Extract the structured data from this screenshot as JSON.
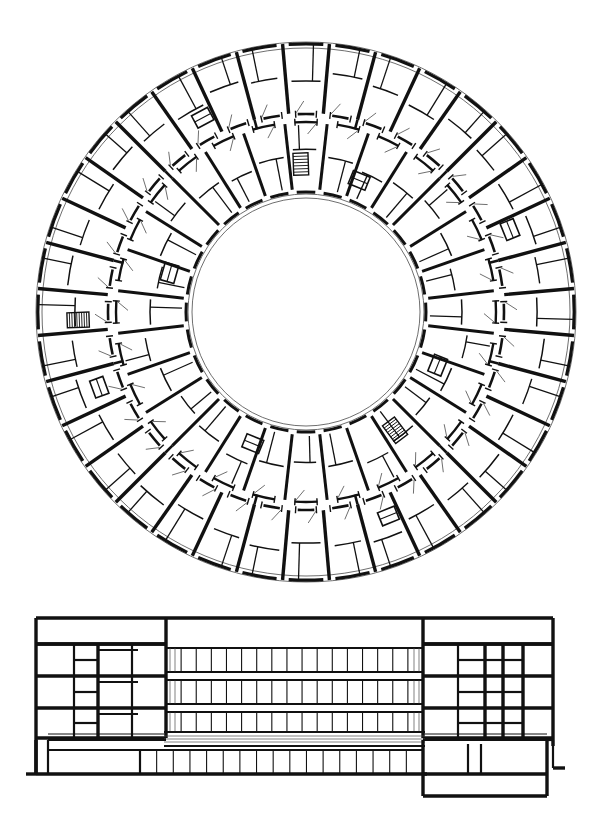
{
  "drawing": {
    "kind": "architectural-drawing",
    "sheet_background": "#ffffff",
    "ink_color": "#111111",
    "hairline_color": "#4a4a4a",
    "sheet_width": 589,
    "sheet_height": 818,
    "figures": [
      {
        "id": "plan",
        "label": "Circular floor plan",
        "caption": ""
      },
      {
        "id": "elevation",
        "label": "Building elevation and section",
        "caption": ""
      }
    ],
    "visible_text": []
  },
  "plan": {
    "title": "",
    "type": "radial-ring-plan",
    "center": {
      "x": 306,
      "y": 312
    },
    "geometry": {
      "outer_wall_radius": 270,
      "outer_wall_inner_radius": 264,
      "outer_ring_inner_radius": 198,
      "corridor_outer_radius": 198,
      "corridor_inner_radius": 190,
      "inner_ring_outer_radius": 190,
      "inner_ring_inner_radius": 122,
      "courtyard_radius": 118,
      "courtyard_inner_radius": 114
    },
    "outer_ring": {
      "bay_count": 36,
      "radial_wall_thickness": 3.4,
      "description": "Outer ring of rooms divided by radial party walls, each bay subdivided by thinner partitions with door swing arcs"
    },
    "inner_ring": {
      "bay_count": 28,
      "radial_wall_thickness": 3.0,
      "description": "Inner ring of rooms facing the central courtyard, divided by radial walls"
    },
    "courtyard": {
      "label": "central open courtyard",
      "fill": "#ffffff"
    },
    "stairs": [
      {
        "angle_deg": 178,
        "ring": "outer",
        "treads": 9,
        "label": "stair"
      },
      {
        "angle_deg": 53,
        "ring": "inner",
        "treads": 8,
        "label": "stair"
      },
      {
        "angle_deg": 268,
        "ring": "inner",
        "treads": 7,
        "label": "stair"
      }
    ],
    "door_openings_per_bay": 1,
    "wall_gaps_deg": 1.6
  },
  "elevation": {
    "title": "",
    "type": "building-section-elevation",
    "frame": {
      "x": 36,
      "y": 22,
      "width": 517,
      "height": 170
    },
    "ground_line_y": 178,
    "levels": [
      {
        "name": "roof",
        "y": 22
      },
      {
        "name": "level-4-floor",
        "y": 48
      },
      {
        "name": "level-3-floor",
        "y": 80
      },
      {
        "name": "level-2-floor",
        "y": 112
      },
      {
        "name": "level-1-floor",
        "y": 142
      },
      {
        "name": "ground",
        "y": 178
      }
    ],
    "left_block": {
      "x": 36,
      "width": 130,
      "label": "sectioned end block — left",
      "floors": 4,
      "cell_columns": [
        0,
        38,
        62,
        96,
        130
      ]
    },
    "center_block": {
      "x": 166,
      "width": 257,
      "label": "glazed curtain wall bays",
      "bays_per_band": 17,
      "bands": 3,
      "lower_bays": 17
    },
    "right_block": {
      "x": 423,
      "width": 130,
      "label": "sectioned end block — right",
      "floors": 3,
      "cell_columns": [
        0,
        35,
        62,
        80,
        100,
        130
      ]
    },
    "plinth": {
      "label": "podium / basement level",
      "y": 142,
      "height": 36
    }
  }
}
